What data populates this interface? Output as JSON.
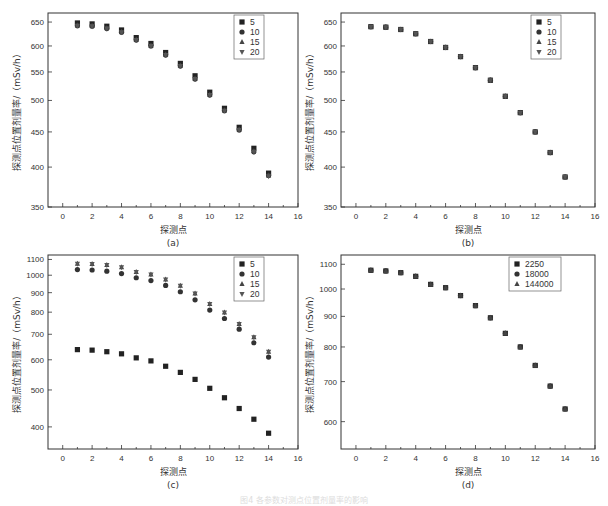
{
  "figure": {
    "caption": "图4 各参数对测点位置剂量率的影响",
    "xlabel": "探测点",
    "ylabel": "探测点位置剂量率/（mSv/h）"
  },
  "chart_data": [
    {
      "panel": "(a)",
      "type": "scatter",
      "xlabel": "探测点",
      "ylabel": "探测点位置剂量率/（mSv/h）",
      "xlim": [
        -1,
        16
      ],
      "ylim": [
        350,
        670
      ],
      "yscale": "log",
      "xticks": [
        0,
        2,
        4,
        6,
        8,
        10,
        12,
        14,
        16
      ],
      "yticks": [
        350,
        400,
        450,
        500,
        550,
        600,
        650
      ],
      "legend": [
        "5",
        "10",
        "15",
        "20"
      ],
      "legend_position": "upper right",
      "x": [
        1,
        2,
        3,
        4,
        5,
        6,
        7,
        8,
        9,
        10,
        11,
        12,
        13,
        14
      ],
      "series": [
        {
          "name": "5",
          "marker": "square",
          "values": [
            648,
            646,
            641,
            633,
            617,
            605,
            587,
            566,
            543,
            514,
            487,
            457,
            426,
            392
          ]
        },
        {
          "name": "10",
          "marker": "circle",
          "values": [
            642,
            641,
            636,
            628,
            612,
            600,
            582,
            561,
            537,
            509,
            483,
            453,
            421,
            389
          ]
        },
        {
          "name": "15",
          "marker": "triangle-up",
          "values": [
            643,
            642,
            637,
            629,
            613,
            601,
            583,
            562,
            538,
            510,
            484,
            454,
            422,
            389
          ]
        },
        {
          "name": "20",
          "marker": "triangle-down",
          "values": [
            642,
            641,
            636,
            628,
            612,
            600,
            582,
            561,
            537,
            509,
            483,
            453,
            421,
            388
          ]
        }
      ]
    },
    {
      "panel": "(b)",
      "type": "scatter",
      "xlabel": "探测点",
      "ylabel": "探测点位置剂量率/（mSv/h）",
      "xlim": [
        -1,
        16
      ],
      "ylim": [
        350,
        670
      ],
      "yscale": "log",
      "xticks": [
        0,
        2,
        4,
        6,
        8,
        10,
        12,
        14,
        16
      ],
      "yticks": [
        350,
        400,
        450,
        500,
        550,
        600,
        650
      ],
      "legend": [
        "5",
        "10",
        "15",
        "20"
      ],
      "legend_position": "upper right",
      "x": [
        1,
        2,
        3,
        4,
        5,
        6,
        7,
        8,
        9,
        10,
        11,
        12,
        13,
        14
      ],
      "series": [
        {
          "name": "5",
          "marker": "square",
          "values": [
            640,
            639,
            634,
            625,
            609,
            597,
            579,
            558,
            535,
            507,
            480,
            450,
            420,
            387
          ]
        },
        {
          "name": "10",
          "marker": "circle",
          "values": [
            640,
            639,
            634,
            625,
            609,
            597,
            579,
            558,
            535,
            507,
            480,
            450,
            420,
            387
          ]
        },
        {
          "name": "15",
          "marker": "triangle-up",
          "values": [
            640,
            639,
            634,
            625,
            609,
            597,
            579,
            558,
            535,
            507,
            480,
            450,
            420,
            387
          ]
        },
        {
          "name": "20",
          "marker": "triangle-down",
          "values": [
            640,
            639,
            634,
            625,
            609,
            597,
            579,
            558,
            535,
            507,
            480,
            450,
            420,
            387
          ]
        }
      ]
    },
    {
      "panel": "(c)",
      "type": "scatter",
      "xlabel": "探测点",
      "ylabel": "探测点位置剂量率/（mSv/h）",
      "xlim": [
        -1,
        16
      ],
      "ylim": [
        350,
        1130
      ],
      "yscale": "log",
      "xticks": [
        0,
        2,
        4,
        6,
        8,
        10,
        12,
        14,
        16
      ],
      "yticks": [
        400,
        500,
        600,
        700,
        800,
        900,
        1000,
        1100
      ],
      "legend": [
        "5",
        "10",
        "15",
        "20"
      ],
      "legend_position": "upper right",
      "x": [
        1,
        2,
        3,
        4,
        5,
        6,
        7,
        8,
        9,
        10,
        11,
        12,
        13,
        14
      ],
      "series": [
        {
          "name": "5",
          "marker": "square",
          "values": [
            638,
            636,
            630,
            622,
            607,
            596,
            577,
            556,
            533,
            505,
            477,
            447,
            419,
            385
          ]
        },
        {
          "name": "10",
          "marker": "circle",
          "values": [
            1035,
            1032,
            1025,
            1010,
            985,
            968,
            940,
            905,
            862,
            810,
            770,
            722,
            665,
            610
          ]
        },
        {
          "name": "15",
          "marker": "triangle-up",
          "values": [
            1072,
            1070,
            1063,
            1050,
            1020,
            1005,
            975,
            938,
            895,
            840,
            798,
            745,
            688,
            630
          ]
        },
        {
          "name": "20",
          "marker": "triangle-down",
          "values": [
            1072,
            1070,
            1063,
            1050,
            1020,
            1005,
            975,
            938,
            895,
            840,
            798,
            745,
            688,
            630
          ]
        }
      ]
    },
    {
      "panel": "(d)",
      "type": "scatter",
      "xlabel": "探测点",
      "ylabel": "探测点位置剂量率/（mSv/h）",
      "xlim": [
        -1,
        16
      ],
      "ylim": [
        540,
        1140
      ],
      "yscale": "log",
      "xticks": [
        0,
        2,
        4,
        6,
        8,
        10,
        12,
        14,
        16
      ],
      "yticks": [
        600,
        700,
        800,
        900,
        1000,
        1100
      ],
      "legend": [
        "2250",
        "18000",
        "144000"
      ],
      "legend_position": "upper right",
      "x": [
        1,
        2,
        3,
        4,
        5,
        6,
        7,
        8,
        9,
        10,
        11,
        12,
        13,
        14
      ],
      "series": [
        {
          "name": "2250",
          "marker": "square",
          "values": [
            1075,
            1072,
            1065,
            1050,
            1018,
            1005,
            975,
            938,
            895,
            843,
            800,
            745,
            688,
            630
          ]
        },
        {
          "name": "18000",
          "marker": "circle",
          "values": [
            1075,
            1072,
            1065,
            1050,
            1018,
            1005,
            975,
            938,
            895,
            843,
            800,
            745,
            688,
            630
          ]
        },
        {
          "name": "144000",
          "marker": "triangle-up",
          "values": [
            1075,
            1072,
            1065,
            1050,
            1018,
            1005,
            975,
            938,
            895,
            843,
            800,
            745,
            688,
            630
          ]
        }
      ]
    }
  ],
  "layout": [
    {
      "left": 48,
      "top": 13,
      "width": 250,
      "height": 194,
      "xmin": -1,
      "xmax": 16,
      "ymin": 350,
      "ymax": 670
    },
    {
      "left": 341,
      "top": 13,
      "width": 254,
      "height": 194,
      "xmin": -1,
      "xmax": 16,
      "ymin": 350,
      "ymax": 670
    },
    {
      "left": 48,
      "top": 255,
      "width": 250,
      "height": 194,
      "xmin": -1,
      "xmax": 16,
      "ymin": 350,
      "ymax": 1130
    },
    {
      "left": 341,
      "top": 255,
      "width": 254,
      "height": 194,
      "xmin": -1,
      "xmax": 16,
      "ymin": 540,
      "ymax": 1140
    }
  ]
}
